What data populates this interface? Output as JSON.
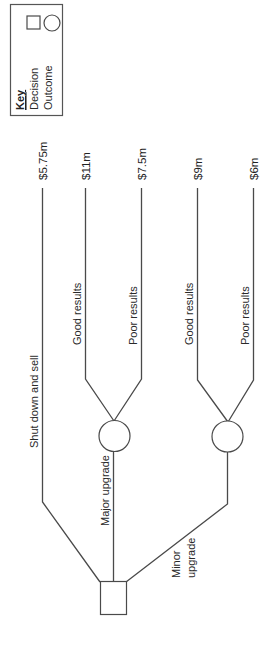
{
  "diagram": {
    "type": "decision-tree",
    "orientation": "rotated-90-ccw",
    "key": {
      "title": "Key",
      "items": [
        {
          "label": "Decision",
          "shape": "square"
        },
        {
          "label": "Outcome",
          "shape": "circle"
        }
      ]
    },
    "decision_node": {
      "shape": "square"
    },
    "branches": [
      {
        "label": "Shut down and sell",
        "value": "$5.75m"
      },
      {
        "label": "Major upgrade",
        "outcome_node": "circle",
        "outcomes": [
          {
            "label": "Good results",
            "value": "$11m"
          },
          {
            "label": "Poor results",
            "value": "$7.5m"
          }
        ]
      },
      {
        "label_lines": [
          "Minor",
          "upgrade"
        ],
        "outcome_node": "circle",
        "outcomes": [
          {
            "label": "Good results",
            "value": "$9m"
          },
          {
            "label": "Poor results",
            "value": "$6m"
          }
        ]
      }
    ]
  }
}
